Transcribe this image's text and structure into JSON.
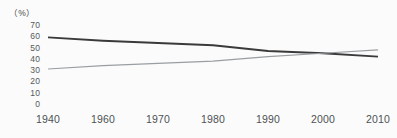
{
  "chart_data": {
    "type": "line",
    "title": "",
    "subtitle": "",
    "xlabel": "",
    "ylabel": "",
    "unit_label": "（%）",
    "ylim": [
      0,
      70
    ],
    "y_ticks": [
      70,
      60,
      50,
      40,
      30,
      20,
      10,
      0
    ],
    "grid": false,
    "legend": "none",
    "x_axis_type": "category",
    "categories": [
      "1940",
      "1960",
      "1970",
      "1980",
      "1990",
      "2000",
      "2010"
    ],
    "series": [
      {
        "name": "declining-series",
        "color": "#3a3a3a",
        "stroke_width": 1.9,
        "values": [
          59,
          56,
          54,
          52,
          47,
          45,
          42
        ]
      },
      {
        "name": "rising-series",
        "color": "#9a9ea1",
        "stroke_width": 1.1,
        "values": [
          31,
          34,
          36,
          38,
          42,
          45,
          48
        ]
      }
    ],
    "annotations": [],
    "crossing_point": {
      "x_approx": "1996",
      "y_approx": 45
    }
  },
  "colors": {
    "background": "#fbfbfb",
    "tick_text": "#55595c",
    "series_dark": "#3a3a3a",
    "series_light": "#9a9ea1"
  }
}
